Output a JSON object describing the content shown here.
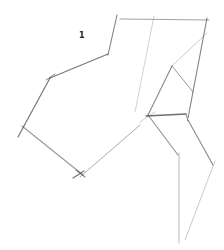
{
  "sketch": {
    "label": {
      "text": "1",
      "x": 79,
      "y": 31
    },
    "stroke_color": "#555555",
    "segments": [
      {
        "x1": 117,
        "y1": 15,
        "x2": 108,
        "y2": 55,
        "w": 1.1,
        "o": 0.75
      },
      {
        "x1": 120,
        "y1": 19,
        "x2": 209,
        "y2": 20,
        "w": 1.0,
        "o": 0.55
      },
      {
        "x1": 108,
        "y1": 54,
        "x2": 50,
        "y2": 78,
        "w": 1.2,
        "o": 0.8
      },
      {
        "x1": 46,
        "y1": 80,
        "x2": 55,
        "y2": 74,
        "w": 1.0,
        "o": 0.7
      },
      {
        "x1": 50,
        "y1": 78,
        "x2": 18,
        "y2": 137,
        "w": 1.2,
        "o": 0.8
      },
      {
        "x1": 154,
        "y1": 16,
        "x2": 135,
        "y2": 112,
        "w": 0.9,
        "o": 0.3
      },
      {
        "x1": 207,
        "y1": 18,
        "x2": 188,
        "y2": 118,
        "w": 1.1,
        "o": 0.75
      },
      {
        "x1": 207,
        "y1": 33,
        "x2": 172,
        "y2": 66,
        "w": 0.9,
        "o": 0.35
      },
      {
        "x1": 172,
        "y1": 66,
        "x2": 148,
        "y2": 115,
        "w": 1.1,
        "o": 0.7
      },
      {
        "x1": 172,
        "y1": 66,
        "x2": 193,
        "y2": 92,
        "w": 1.0,
        "o": 0.6
      },
      {
        "x1": 146,
        "y1": 116,
        "x2": 186,
        "y2": 114,
        "w": 1.3,
        "o": 0.85
      },
      {
        "x1": 186,
        "y1": 114,
        "x2": 188,
        "y2": 121,
        "w": 1.0,
        "o": 0.7
      },
      {
        "x1": 148,
        "y1": 115,
        "x2": 178,
        "y2": 155,
        "w": 1.1,
        "o": 0.65
      },
      {
        "x1": 188,
        "y1": 120,
        "x2": 213,
        "y2": 165,
        "w": 1.1,
        "o": 0.7
      },
      {
        "x1": 215,
        "y1": 161,
        "x2": 185,
        "y2": 240,
        "w": 0.9,
        "o": 0.35
      },
      {
        "x1": 179,
        "y1": 153,
        "x2": 179,
        "y2": 243,
        "w": 0.9,
        "o": 0.45
      },
      {
        "x1": 22,
        "y1": 126,
        "x2": 83,
        "y2": 175,
        "w": 1.1,
        "o": 0.6
      },
      {
        "x1": 140,
        "y1": 125,
        "x2": 80,
        "y2": 177,
        "w": 1.0,
        "o": 0.5
      },
      {
        "x1": 73,
        "y1": 178,
        "x2": 84,
        "y2": 171,
        "w": 1.3,
        "o": 0.8
      },
      {
        "x1": 76,
        "y1": 170,
        "x2": 85,
        "y2": 177,
        "w": 1.1,
        "o": 0.7
      },
      {
        "x1": 140,
        "y1": 122,
        "x2": 155,
        "y2": 112,
        "w": 0.9,
        "o": 0.35
      }
    ]
  }
}
